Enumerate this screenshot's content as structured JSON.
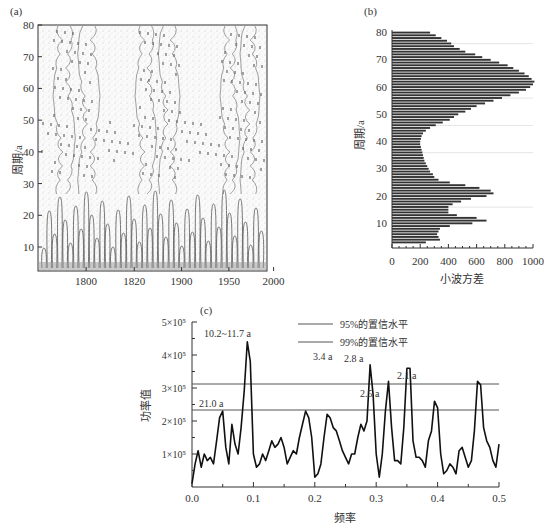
{
  "panels": {
    "a": {
      "label": "(a)",
      "ylabel": "周期/a",
      "yticks": [
        10,
        20,
        30,
        40,
        50,
        60,
        70,
        80
      ],
      "xticks": [
        "1800",
        "1820",
        "1900",
        "1950",
        "2000"
      ]
    },
    "b": {
      "label": "(b)",
      "ylabel": "周期/a",
      "xlabel": "小波方差",
      "yticks": [
        10,
        20,
        30,
        40,
        50,
        60,
        70,
        80
      ],
      "xticks": [
        "0",
        "200",
        "400",
        "600",
        "800",
        "1000"
      ]
    },
    "c": {
      "label": "(c)",
      "ylabel": "功率值",
      "xlabel": "频率",
      "yticks": [
        "1×10⁵",
        "2×10⁵",
        "3×10⁵",
        "4×10⁵",
        "5×10⁵"
      ],
      "xticks": [
        "0.0",
        "0.1",
        "0.2",
        "0.3",
        "0.4",
        "0.5"
      ],
      "legend": [
        "95%的置信水平",
        "99%的置信水平"
      ],
      "annotations": [
        "10.2~11.7 a",
        "21.0 a",
        "3.4 a",
        "2.8 a",
        "2.5 a",
        "2.1 a"
      ]
    }
  },
  "chart_data": [
    {
      "type": "heatmap",
      "title": "(a) Wavelet transform contour",
      "xlabel": "",
      "ylabel": "周期/a",
      "x_tick_labels": [
        "1800",
        "1820",
        "1900",
        "1950",
        "2000"
      ],
      "y_range": [
        1,
        80
      ],
      "yticks": [
        10,
        20,
        30,
        40,
        50,
        60,
        70,
        80
      ],
      "description": "Wavelet coefficient contour plot; alternating high/low bands at ~60-70a period and dense small-scale oscillation structures below 20a"
    },
    {
      "type": "bar",
      "orientation": "horizontal",
      "title": "(b)",
      "xlabel": "小波方差",
      "ylabel": "周期/a",
      "xlim": [
        0,
        1000
      ],
      "ylim": [
        0,
        80
      ],
      "categories": [
        2,
        3,
        4,
        5,
        6,
        7,
        8,
        9,
        10,
        11,
        12,
        13,
        14,
        15,
        16,
        17,
        18,
        19,
        20,
        21,
        22,
        23,
        24,
        25,
        26,
        27,
        28,
        29,
        30,
        31,
        32,
        33,
        34,
        35,
        36,
        37,
        38,
        39,
        40,
        41,
        42,
        43,
        44,
        45,
        46,
        47,
        48,
        49,
        50,
        51,
        52,
        53,
        54,
        55,
        56,
        57,
        58,
        59,
        60,
        61,
        62,
        63,
        64,
        65,
        66,
        67,
        68,
        69,
        70,
        71,
        72,
        73,
        74,
        75,
        76,
        77,
        78,
        79
      ],
      "values": [
        240,
        340,
        330,
        320,
        330,
        340,
        410,
        570,
        670,
        600,
        460,
        400,
        400,
        400,
        430,
        490,
        560,
        670,
        720,
        700,
        620,
        520,
        410,
        330,
        300,
        290,
        270,
        260,
        250,
        240,
        230,
        225,
        220,
        215,
        210,
        205,
        200,
        200,
        205,
        210,
        220,
        240,
        270,
        310,
        360,
        410,
        440,
        470,
        520,
        560,
        600,
        660,
        720,
        780,
        840,
        900,
        950,
        980,
        1000,
        1010,
        990,
        970,
        940,
        900,
        860,
        820,
        760,
        700,
        640,
        590,
        520,
        480,
        440,
        420,
        390,
        350,
        310,
        270
      ]
    },
    {
      "type": "line",
      "title": "(c)",
      "xlabel": "频率",
      "ylabel": "功率值",
      "xlim": [
        0,
        0.5
      ],
      "ylim": [
        0,
        500000
      ],
      "series": [
        {
          "name": "power spectrum",
          "x": [
            0.0,
            0.005,
            0.01,
            0.015,
            0.02,
            0.025,
            0.03,
            0.035,
            0.04,
            0.045,
            0.05,
            0.055,
            0.06,
            0.065,
            0.07,
            0.075,
            0.08,
            0.085,
            0.09,
            0.095,
            0.1,
            0.105,
            0.11,
            0.115,
            0.12,
            0.125,
            0.13,
            0.135,
            0.14,
            0.145,
            0.15,
            0.155,
            0.16,
            0.165,
            0.17,
            0.175,
            0.18,
            0.185,
            0.19,
            0.195,
            0.2,
            0.205,
            0.21,
            0.215,
            0.22,
            0.225,
            0.23,
            0.235,
            0.24,
            0.245,
            0.25,
            0.255,
            0.26,
            0.265,
            0.27,
            0.275,
            0.28,
            0.285,
            0.29,
            0.295,
            0.3,
            0.305,
            0.31,
            0.315,
            0.32,
            0.325,
            0.33,
            0.335,
            0.34,
            0.345,
            0.35,
            0.355,
            0.36,
            0.365,
            0.37,
            0.375,
            0.38,
            0.385,
            0.39,
            0.395,
            0.4,
            0.405,
            0.41,
            0.415,
            0.42,
            0.425,
            0.43,
            0.435,
            0.44,
            0.445,
            0.45,
            0.455,
            0.46,
            0.465,
            0.47,
            0.475,
            0.48,
            0.485,
            0.49,
            0.495,
            0.5
          ],
          "values": [
            10000,
            70000,
            110000,
            60000,
            100000,
            80000,
            90000,
            70000,
            140000,
            210000,
            230000,
            120000,
            70000,
            190000,
            130000,
            100000,
            180000,
            290000,
            440000,
            380000,
            100000,
            60000,
            70000,
            100000,
            80000,
            110000,
            140000,
            120000,
            130000,
            150000,
            120000,
            70000,
            90000,
            110000,
            100000,
            150000,
            190000,
            230000,
            210000,
            150000,
            30000,
            40000,
            70000,
            150000,
            220000,
            210000,
            180000,
            170000,
            140000,
            110000,
            90000,
            70000,
            100000,
            100000,
            150000,
            190000,
            170000,
            200000,
            370000,
            280000,
            100000,
            30000,
            100000,
            230000,
            320000,
            180000,
            80000,
            80000,
            70000,
            180000,
            360000,
            360000,
            140000,
            90000,
            90000,
            80000,
            60000,
            140000,
            170000,
            260000,
            240000,
            100000,
            40000,
            50000,
            70000,
            60000,
            40000,
            110000,
            120000,
            90000,
            60000,
            80000,
            170000,
            320000,
            310000,
            180000,
            140000,
            120000,
            80000,
            60000,
            130000
          ]
        },
        {
          "name": "95%的置信水平",
          "values": [
            310000
          ]
        },
        {
          "name": "99%的置信水平",
          "values": [
            235000
          ]
        }
      ],
      "legend": [
        "95%的置信水平",
        "99%的置信水平"
      ],
      "annotations": [
        {
          "text": "10.2~11.7 a",
          "x": 0.09
        },
        {
          "text": "21.0 a",
          "x": 0.048
        },
        {
          "text": "3.4 a",
          "x": 0.295
        },
        {
          "text": "2.8 a",
          "x": 0.36
        },
        {
          "text": "2.5 a",
          "x": 0.4
        },
        {
          "text": "2.1 a",
          "x": 0.475
        }
      ]
    }
  ]
}
